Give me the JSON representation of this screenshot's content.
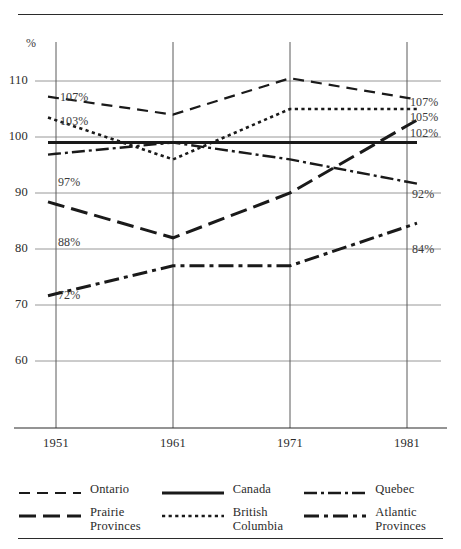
{
  "chart_data": {
    "type": "line",
    "title": "",
    "subtitle": "",
    "xlabel": "",
    "ylabel": "%",
    "unit_symbol": "%",
    "x": [
      "1951",
      "1961",
      "1971",
      "1981"
    ],
    "categories": [
      "1951",
      "1961",
      "1971",
      "1981"
    ],
    "xlim": [
      1948,
      1984
    ],
    "ylim": [
      57,
      115
    ],
    "yticks": [
      60,
      70,
      80,
      90,
      100,
      110
    ],
    "ytick_labels": [
      "60",
      "70",
      "80",
      "90",
      "100",
      "110"
    ],
    "grid": true,
    "legend_position": "bottom",
    "series": [
      {
        "name": "Ontario",
        "style": "dashed",
        "values": [
          107,
          104,
          110.5,
          107
        ],
        "start_label": "107%",
        "end_label": "107%"
      },
      {
        "name": "British Columbia",
        "style": "dotted",
        "values": [
          103,
          96,
          105,
          105
        ],
        "start_label": "103%",
        "end_label": "105%"
      },
      {
        "name": "Canada",
        "style": "solid",
        "values": [
          99,
          99,
          99,
          99
        ],
        "start_label": "",
        "end_label": ""
      },
      {
        "name": "Prairie Provinces",
        "style": "long-dash",
        "values": [
          88,
          82,
          90,
          102
        ],
        "start_label": "88%",
        "end_label": "102%"
      },
      {
        "name": "Quebec",
        "style": "dash-dot-thin",
        "values": [
          97,
          99,
          96,
          92
        ],
        "start_label": "97%",
        "end_label": "92%"
      },
      {
        "name": "Atlantic Provinces",
        "style": "dash-dot-heavy",
        "values": [
          72,
          77,
          77,
          84
        ],
        "start_label": "72%",
        "end_label": "84%"
      }
    ],
    "annotations": {
      "left": [
        "107%",
        "103%",
        "97%",
        "88%",
        "72%"
      ],
      "right": [
        "107%",
        "105%",
        "102%",
        "92%",
        "84%"
      ]
    }
  },
  "axis": {
    "y_unit": "%",
    "y_ticks": [
      {
        "label": "110",
        "value": 110
      },
      {
        "label": "100",
        "value": 100
      },
      {
        "label": "90",
        "value": 90
      },
      {
        "label": "80",
        "value": 80
      },
      {
        "label": "70",
        "value": 70
      },
      {
        "label": "60",
        "value": 60
      }
    ],
    "x_ticks": [
      {
        "label": "1951"
      },
      {
        "label": "1961"
      },
      {
        "label": "1971"
      },
      {
        "label": "1981"
      }
    ]
  },
  "labels": {
    "left": [
      {
        "text": "107%"
      },
      {
        "text": "103%"
      },
      {
        "text": "97%"
      },
      {
        "text": "88%"
      },
      {
        "text": "72%"
      }
    ],
    "right": [
      {
        "text": "107%"
      },
      {
        "text": "105%"
      },
      {
        "text": "102%"
      },
      {
        "text": "92%"
      },
      {
        "text": "84%"
      }
    ]
  },
  "legend": {
    "columns": [
      {
        "entries": [
          {
            "label": "Ontario",
            "label_line2": "",
            "style": "dashed"
          },
          {
            "label": "Prairie",
            "label_line2": "Provinces",
            "style": "long-dash"
          }
        ]
      },
      {
        "entries": [
          {
            "label": "Canada",
            "label_line2": "",
            "style": "solid"
          },
          {
            "label": "British",
            "label_line2": "Columbia",
            "style": "dotted"
          }
        ]
      },
      {
        "entries": [
          {
            "label": "Quebec",
            "label_line2": "",
            "style": "dash-dot-thin"
          },
          {
            "label": "Atlantic",
            "label_line2": "Provinces",
            "style": "dash-dot-heavy"
          }
        ]
      }
    ]
  },
  "colors": {
    "ink": "#1a1a1a",
    "grid": "#8c8c8c",
    "rule": "#2b2b2b",
    "background": "#ffffff"
  }
}
